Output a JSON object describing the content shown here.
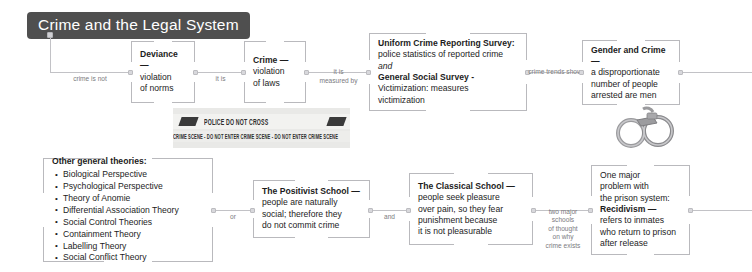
{
  "title": {
    "text": "Crime and the Legal System"
  },
  "colors": {
    "title_bg": "#4f4f4f",
    "title_fg": "#ffffff",
    "line": "#c2c2c6",
    "bracket": "#b9b9bd",
    "text": "#1c1c1c",
    "label": "#7b7b80"
  },
  "top_row": {
    "nodes": [
      {
        "id": "deviance",
        "heading": "Deviance —",
        "lines": [
          "violation",
          "of norms"
        ]
      },
      {
        "id": "crime",
        "heading": "Crime —",
        "lines": [
          "violation",
          "of laws"
        ]
      },
      {
        "id": "surveys",
        "heading": "Uniform Crime Reporting Survey:",
        "lines": [
          "police statistics of reported crime"
        ],
        "italic_line": "and",
        "heading2": "General Social Survey -",
        "lines2": [
          "Victimization: measures",
          "victimization"
        ]
      },
      {
        "id": "gender-and-crime",
        "heading": "Gender and Crime —",
        "lines": [
          "a disproportionate",
          "number of people",
          "arrested are men"
        ]
      }
    ],
    "connectors": [
      {
        "id": "crime-is-not",
        "label": "crime is not"
      },
      {
        "id": "it-is",
        "label": "it is"
      },
      {
        "id": "it-is-measured-by",
        "label": "it is\nmeasured by"
      },
      {
        "id": "crime-trends-show",
        "label": "crime trends show"
      }
    ]
  },
  "bottom_row": {
    "nodes": [
      {
        "id": "other-general-theories",
        "heading": "Other general theories:",
        "items": [
          "Biological Perspective",
          "Psychological Perspective",
          "Theory of Anomie",
          "Differential Association Theory",
          "Social Control Theories",
          "Containment Theory",
          "Labelling Theory",
          "Social Conflict Theory"
        ]
      },
      {
        "id": "positivist-school",
        "heading": "The Positivist School —",
        "lines": [
          "people are naturally",
          "social; therefore they",
          "do not commit crime"
        ]
      },
      {
        "id": "classical-school",
        "heading": "The Classical School —",
        "lines": [
          "people seek pleasure",
          "over pain, so they fear",
          "punishment because",
          "it is not pleasurable"
        ]
      },
      {
        "id": "recidivism",
        "lines_before": [
          "One major",
          "problem with",
          "the prison system:"
        ],
        "heading": "Recidivism —",
        "lines": [
          "refers to inmates",
          "who return to prison",
          "after release"
        ]
      }
    ],
    "connectors": [
      {
        "id": "or",
        "label": "or"
      },
      {
        "id": "and",
        "label": "and"
      },
      {
        "id": "two-major-schools",
        "label": "two major\nschools\nof thought\non why\ncrime exists"
      }
    ]
  },
  "images": {
    "police_tape": {
      "name": "police-tape-photo",
      "upper_text": "POLICE DO NOT CROSS",
      "lower_text": "CRIME SCENE - DO NOT ENTER  CRIME SCENE - DO NOT ENTER  CRIME SCENE"
    },
    "handcuffs": {
      "name": "handcuffs-photo"
    }
  }
}
